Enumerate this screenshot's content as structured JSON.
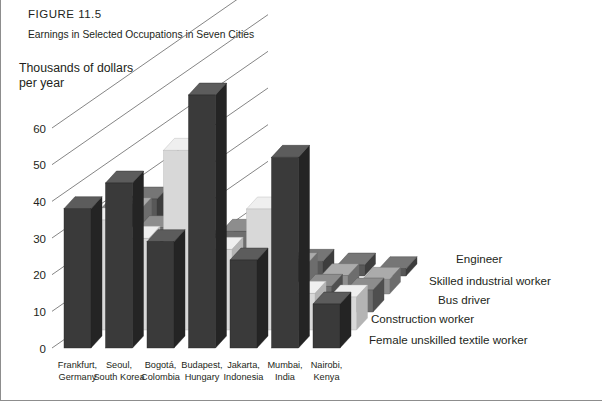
{
  "figure": {
    "number": "FIGURE 11.5",
    "caption": "Earnings in Selected Occupations in Seven Cities"
  },
  "chart_data": {
    "type": "bar",
    "title": "Earnings in Selected Occupations in Seven Cities",
    "subtitle": "FIGURE 11.5",
    "xlabel": "",
    "ylabel": "Thousands of dollars per year",
    "ylabel_lines": [
      "Thousands of dollars",
      "per year"
    ],
    "ylim": [
      0,
      60
    ],
    "yticks": [
      0,
      10,
      20,
      30,
      40,
      50,
      60
    ],
    "ytick_labels": [
      "0",
      "10",
      "20",
      "30",
      "40",
      "50",
      "60"
    ],
    "grid": false,
    "legend_position": "right",
    "projection": "3d-isometric",
    "categories": [
      "Frankfurt, Germany",
      "Seoul, South Korea",
      "Bogotá, Colombia",
      "Budapest, Hungary",
      "Jakarta, Indonesia",
      "Mumbai, India",
      "Nairobi, Kenya"
    ],
    "category_lines": [
      [
        "Frankfurt,",
        "Germany"
      ],
      [
        "Seoul,",
        "South Korea"
      ],
      [
        "Bogotá,",
        "Colombia"
      ],
      [
        "Budapest,",
        "Hungary"
      ],
      [
        "Jakarta,",
        "Indonesia"
      ],
      [
        "Mumbai,",
        "India"
      ],
      [
        "Nairobi,",
        "Kenya"
      ]
    ],
    "series": [
      {
        "name": "Engineer",
        "color": "#3a3a3a",
        "color_top": "#5c5c5c",
        "color_side": "#242424",
        "values": [
          38,
          45,
          29,
          69,
          24,
          52,
          12
        ]
      },
      {
        "name": "Skilled industrial worker",
        "color": "#d8d8d8",
        "color_top": "#efefef",
        "color_side": "#b4b4b4",
        "values": [
          30,
          25,
          49,
          22,
          33,
          10,
          9
        ]
      },
      {
        "name": "Bus driver",
        "color": "#6e6e6e",
        "color_top": "#8d8d8d",
        "color_side": "#4f4f4f",
        "values": [
          27,
          23,
          18,
          22,
          12,
          7,
          6
        ]
      },
      {
        "name": "Construction worker",
        "color": "#8f8f8f",
        "color_top": "#ababab",
        "color_side": "#6d6d6d",
        "values": [
          23,
          17,
          14,
          14,
          8,
          5,
          4
        ]
      },
      {
        "name": "Female unskilled textile worker",
        "color": "#585858",
        "color_top": "#767676",
        "color_side": "#3d3d3d",
        "values": [
          21,
          12,
          9,
          11,
          4,
          3,
          2
        ]
      }
    ]
  }
}
